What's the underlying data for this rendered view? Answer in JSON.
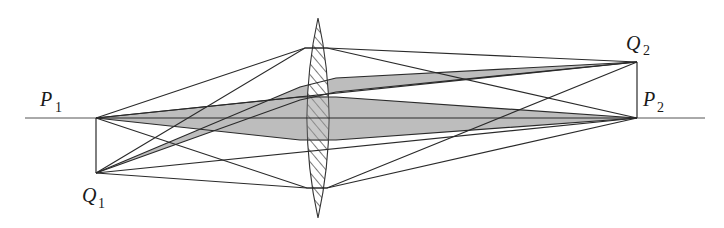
{
  "diagram": {
    "labels": {
      "p1": {
        "main": "P",
        "sub": "1"
      },
      "q1": {
        "main": "Q",
        "sub": "1"
      },
      "p2": {
        "main": "P",
        "sub": "2"
      },
      "q2": {
        "main": "Q",
        "sub": "2"
      }
    },
    "points": {
      "P1": [
        96,
        118
      ],
      "Q1": [
        96,
        173
      ],
      "P2": [
        637,
        118
      ],
      "Q2": [
        637,
        62
      ]
    },
    "lens": {
      "center_x": 318,
      "top_y": 18,
      "bottom_y": 218,
      "half_width": 18,
      "fill": "hatched"
    },
    "colors": {
      "line": "#2a2a2a",
      "shade": "#b8b8b8",
      "hatch": "#333333"
    }
  }
}
